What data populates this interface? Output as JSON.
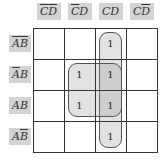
{
  "kmap": {
    "variables": [
      "A",
      "B",
      "C",
      "D"
    ],
    "columns": [
      {
        "label_parts": [
          {
            "t": "C",
            "bar": true
          },
          {
            "t": "D",
            "bar": true
          }
        ]
      },
      {
        "label_parts": [
          {
            "t": "C",
            "bar": true
          },
          {
            "t": "D",
            "bar": false
          }
        ]
      },
      {
        "label_parts": [
          {
            "t": "C",
            "bar": false
          },
          {
            "t": "D",
            "bar": false
          }
        ]
      },
      {
        "label_parts": [
          {
            "t": "C",
            "bar": false
          },
          {
            "t": "D",
            "bar": true
          }
        ]
      }
    ],
    "rows": [
      {
        "label_parts": [
          {
            "t": "A",
            "bar": true
          },
          {
            "t": "B",
            "bar": true
          }
        ]
      },
      {
        "label_parts": [
          {
            "t": "A",
            "bar": true
          },
          {
            "t": "B",
            "bar": false
          }
        ]
      },
      {
        "label_parts": [
          {
            "t": "A",
            "bar": false
          },
          {
            "t": "B",
            "bar": false
          }
        ]
      },
      {
        "label_parts": [
          {
            "t": "A",
            "bar": false
          },
          {
            "t": "B",
            "bar": true
          }
        ]
      }
    ],
    "cells": [
      [
        "",
        "",
        "1",
        ""
      ],
      [
        "",
        "1",
        "1",
        ""
      ],
      [
        "",
        "1",
        "1",
        ""
      ],
      [
        "",
        "",
        "1",
        ""
      ]
    ],
    "groups": [
      {
        "name": "column-CD",
        "row_start": 0,
        "row_end": 3,
        "col_start": 2,
        "col_end": 2
      },
      {
        "name": "square-BD",
        "row_start": 1,
        "row_end": 2,
        "col_start": 1,
        "col_end": 2
      }
    ]
  }
}
